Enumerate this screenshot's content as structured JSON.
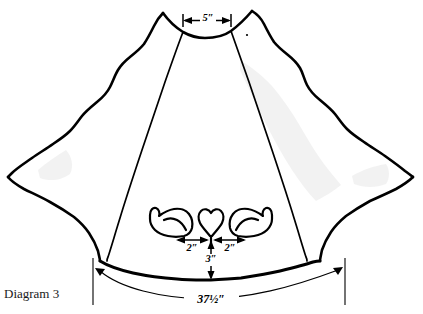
{
  "figure": {
    "caption": "Diagram 3",
    "caption_position": {
      "x": 4,
      "y": 286
    }
  },
  "dimensions": {
    "neck_width": {
      "label": "5″",
      "value": 5,
      "unit": "inch",
      "description": "neckline opening width across the top"
    },
    "motif_left_offset": {
      "label": "2″",
      "value": 2,
      "unit": "inch",
      "description": "distance from center heart to left bird"
    },
    "motif_right_offset": {
      "label": "2″",
      "value": 2,
      "unit": "inch",
      "description": "distance from center heart to right bird"
    },
    "motif_hem_height": {
      "label": "3″",
      "value": 3,
      "unit": "inch",
      "description": "distance from bottom of heart motif down to hem edge"
    },
    "hem_width": {
      "label": "37½″",
      "value": 37.5,
      "unit": "inch",
      "description": "total width of the hem arc at the bottom"
    }
  },
  "motif": {
    "left_bird": "bird-applique-left",
    "heart": "heart-applique-center",
    "right_bird": "bird-applique-right"
  },
  "colors": {
    "outline": "#000000",
    "fill": "#ffffff",
    "shading": "#ededed",
    "caption": "#1a1a1a"
  }
}
